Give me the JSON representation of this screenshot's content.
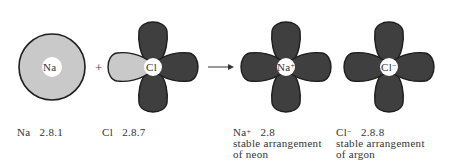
{
  "diagram": {
    "colors": {
      "light_fill": "#c9c9c9",
      "dark_fill": "#3f3f3f",
      "outline": "#1e1e1e",
      "core": "#ffffff"
    },
    "symbols": {
      "plus": "+",
      "arrow": "→"
    },
    "atoms": [
      {
        "id": "na",
        "core_label": "Na",
        "charge": "",
        "config_symbol": "Na",
        "config": "2.8.1",
        "note_line1": "",
        "note_line2": ""
      },
      {
        "id": "cl",
        "core_label": "Cl",
        "charge": "",
        "config_symbol": "Cl",
        "config": "2.8.7",
        "note_line1": "",
        "note_line2": ""
      },
      {
        "id": "na_ion",
        "core_label": "Na",
        "charge": "+",
        "config_symbol": "Na",
        "config_charge": "+",
        "config": "2.8",
        "note_line1": "stable arrangement",
        "note_line2": "of neon"
      },
      {
        "id": "cl_ion",
        "core_label": "Cl",
        "charge": "−",
        "config_symbol": "Cl",
        "config_charge": "−",
        "config": "2.8.8",
        "note_line1": "stable arrangement",
        "note_line2": "of argon"
      }
    ]
  }
}
